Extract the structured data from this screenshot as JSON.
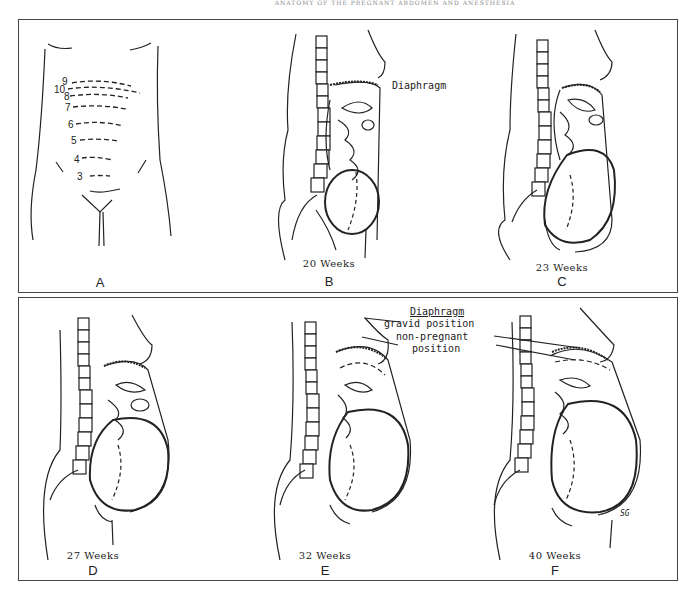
{
  "header": {
    "text": "ANATOMY OF THE PREGNANT ABDOMEN AND ANESTHESIA"
  },
  "figures": [
    {
      "letter": "A",
      "caption": ""
    },
    {
      "letter": "B",
      "caption": "20 Weeks"
    },
    {
      "letter": "C",
      "caption": "23 Weeks"
    },
    {
      "letter": "D",
      "caption": "27 Weeks"
    },
    {
      "letter": "E",
      "caption": "32 Weeks"
    },
    {
      "letter": "F",
      "caption": "40 Weeks"
    }
  ],
  "fundus_levels": [
    "9",
    "10",
    "8",
    "7",
    "6",
    "5",
    "4",
    "3"
  ],
  "vertebrae": [
    "9",
    "10",
    "11",
    "12",
    "1",
    "2",
    "3",
    "4",
    "5"
  ],
  "annotations": {
    "diaphragm_b": "Diaphragm",
    "diaphragm_title": "Diaphragm",
    "gravid": "gravid position",
    "nonpreg1": "non-pregnant",
    "nonpreg2": "position",
    "signature": "SG"
  }
}
